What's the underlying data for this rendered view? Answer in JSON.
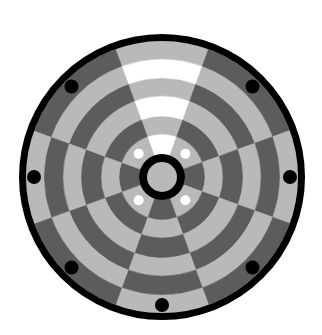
{
  "board": {
    "type": "circular-board",
    "center": [
      162,
      177
    ],
    "outer_radius": 143,
    "border_inner_radius": 136,
    "hub": {
      "outer_radius": 23,
      "inner_radius": 15,
      "ring_color": "#000000",
      "fill": "#b9b9b9"
    },
    "ring_radii": [
      23,
      43,
      61,
      81,
      99,
      118,
      136
    ],
    "colors": {
      "light": "#b9b9b9",
      "dark": "#5c5c5c",
      "white": "#ffffff",
      "border": "#000000",
      "background": "#ffffff"
    },
    "sectors": [
      {
        "name": "top",
        "start": -20,
        "end": 20,
        "rings": [
          "white",
          "light",
          "white",
          "light",
          "white",
          "light"
        ]
      },
      {
        "name": "upper-right",
        "start": 20,
        "end": 70,
        "rings": [
          "light",
          "dark",
          "light",
          "dark",
          "light",
          "dark"
        ]
      },
      {
        "name": "right",
        "start": 70,
        "end": 110,
        "rings": [
          "dark",
          "light",
          "dark",
          "light",
          "dark",
          "light"
        ]
      },
      {
        "name": "lower-right",
        "start": 110,
        "end": 160,
        "rings": [
          "light",
          "dark",
          "light",
          "dark",
          "light",
          "dark"
        ]
      },
      {
        "name": "bottom",
        "start": 160,
        "end": 200,
        "rings": [
          "dark",
          "light",
          "dark",
          "light",
          "dark",
          "light"
        ]
      },
      {
        "name": "lower-left",
        "start": 200,
        "end": 250,
        "rings": [
          "light",
          "dark",
          "light",
          "dark",
          "light",
          "dark"
        ]
      },
      {
        "name": "left",
        "start": 250,
        "end": 290,
        "rings": [
          "dark",
          "light",
          "dark",
          "light",
          "dark",
          "light"
        ]
      },
      {
        "name": "upper-left",
        "start": 290,
        "end": 340,
        "rings": [
          "light",
          "dark",
          "light",
          "dark",
          "light",
          "dark"
        ]
      }
    ],
    "inner_markers": {
      "radius": 33,
      "dot_radius": 5,
      "color": "#ffffff",
      "angles": [
        45,
        135,
        225,
        315
      ]
    },
    "outer_markers": {
      "radius": 128,
      "dot_radius": 7,
      "color": "#000000",
      "angles": [
        45,
        90,
        135,
        180,
        225,
        270,
        315
      ]
    }
  }
}
